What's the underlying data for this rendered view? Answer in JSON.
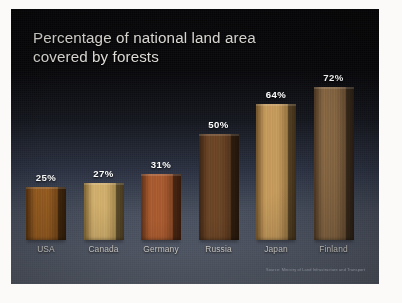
{
  "slide": {
    "title_line1": "Percentage of national land area",
    "title_line2": "covered by forests",
    "source_note": "Source: Ministry of Land Infrastructure and Transport",
    "background_top_color": "#070709",
    "background_bottom_color": "#5a616e",
    "title_color": "#dedbd6",
    "label_color": "#ffffff",
    "category_label_color": "#d9d6d1"
  },
  "chart_data": {
    "type": "bar",
    "title": "Percentage of national land area covered by forests",
    "xlabel": "",
    "ylabel": "",
    "ylim": [
      0,
      80
    ],
    "grid": false,
    "legend": "none",
    "unit": "%",
    "categories": [
      "USA",
      "Canada",
      "Germany",
      "Russia",
      "Japan",
      "Finland"
    ],
    "values": [
      25,
      27,
      31,
      50,
      64,
      72
    ],
    "value_labels": [
      "25%",
      "27%",
      "31%",
      "50%",
      "64%",
      "72%"
    ],
    "bar_colors": [
      "#9a5f22",
      "#cfae6c",
      "#a85b30",
      "#6b4526",
      "#c49a5c",
      "#8a6a45"
    ],
    "annotations": [
      "Source: Ministry of Land Infrastructure and Transport"
    ]
  },
  "bars": [
    {
      "label": "USA",
      "value_label": "25%",
      "color": "#9a5f22",
      "color_dark": "#53300f"
    },
    {
      "label": "Canada",
      "value_label": "27%",
      "color": "#cfae6c",
      "color_dark": "#7b6232"
    },
    {
      "label": "Germany",
      "value_label": "31%",
      "color": "#a85b30",
      "color_dark": "#5d2f16"
    },
    {
      "label": "Russia",
      "value_label": "50%",
      "color": "#6b4526",
      "color_dark": "#3b2412"
    },
    {
      "label": "Japan",
      "value_label": "64%",
      "color": "#c49a5c",
      "color_dark": "#6d5129"
    },
    {
      "label": "Finland",
      "value_label": "72%",
      "color": "#8a6a45",
      "color_dark": "#4a3522"
    }
  ]
}
